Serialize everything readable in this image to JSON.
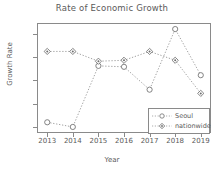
{
  "chart_data": {
    "type": "line",
    "title": "Rate of Economic Growth",
    "xlabel": "Year",
    "ylabel": "Growth Rate",
    "categories": [
      "2013",
      "2014",
      "2015",
      "2016",
      "2017",
      "2018",
      "2019"
    ],
    "x": [
      2013,
      2014,
      2015,
      2016,
      2017,
      2018,
      2019
    ],
    "series": [
      {
        "name": "Seoul",
        "marker": "circle",
        "linestyle": "dotted",
        "color": "#8a8a8a",
        "values": [
          1.6,
          1.5,
          2.81,
          2.79,
          2.3,
          3.6,
          2.61
        ]
      },
      {
        "name": "nationwide",
        "marker": "diamond",
        "linestyle": "dotted",
        "color": "#8a8a8a",
        "values": [
          3.12,
          3.12,
          2.91,
          2.93,
          3.12,
          2.93,
          2.22
        ]
      }
    ],
    "yticks": [
      1.5,
      2.0,
      2.5,
      3.0,
      3.5
    ],
    "ytick_labels": [
      "1.5",
      "2.0",
      "2.5",
      "3.0",
      "3.5"
    ],
    "ylim": [
      1.37,
      3.73
    ],
    "xlim": [
      2012.6,
      2019.4
    ],
    "grid": false,
    "legend_position": "bottom-right",
    "legend_entries": [
      "Seoul",
      "nationwide"
    ]
  }
}
